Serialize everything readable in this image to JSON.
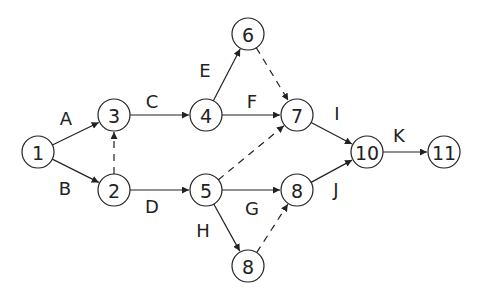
{
  "diagram": {
    "type": "activity-on-arrow network",
    "node_radius": 16,
    "colors": {
      "stroke": "#222222",
      "background": "#ffffff"
    },
    "nodes": [
      {
        "id": "n1",
        "label": "1",
        "x": 38,
        "y": 152
      },
      {
        "id": "n2",
        "label": "2",
        "x": 114,
        "y": 190
      },
      {
        "id": "n3",
        "label": "3",
        "x": 114,
        "y": 115
      },
      {
        "id": "n4",
        "label": "4",
        "x": 206,
        "y": 115
      },
      {
        "id": "n5",
        "label": "5",
        "x": 206,
        "y": 190
      },
      {
        "id": "n6",
        "label": "6",
        "x": 248,
        "y": 34
      },
      {
        "id": "n7",
        "label": "7",
        "x": 297,
        "y": 115
      },
      {
        "id": "n8a",
        "label": "8",
        "x": 297,
        "y": 190
      },
      {
        "id": "n8b",
        "label": "8",
        "x": 248,
        "y": 266
      },
      {
        "id": "n10",
        "label": "10",
        "x": 367,
        "y": 152
      },
      {
        "id": "n11",
        "label": "11",
        "x": 444,
        "y": 152
      }
    ],
    "edges": [
      {
        "from": "n1",
        "to": "n3",
        "label": "A",
        "dashed": false,
        "lx": 66,
        "ly": 118
      },
      {
        "from": "n1",
        "to": "n2",
        "label": "B",
        "dashed": false,
        "lx": 65,
        "ly": 188
      },
      {
        "from": "n2",
        "to": "n3",
        "label": "",
        "dashed": true
      },
      {
        "from": "n3",
        "to": "n4",
        "label": "C",
        "dashed": false,
        "lx": 152,
        "ly": 101
      },
      {
        "from": "n2",
        "to": "n5",
        "label": "D",
        "dashed": false,
        "lx": 152,
        "ly": 206
      },
      {
        "from": "n4",
        "to": "n6",
        "label": "E",
        "dashed": false,
        "lx": 205,
        "ly": 70
      },
      {
        "from": "n4",
        "to": "n7",
        "label": "F",
        "dashed": false,
        "lx": 252,
        "ly": 101
      },
      {
        "from": "n6",
        "to": "n7",
        "label": "",
        "dashed": true
      },
      {
        "from": "n5",
        "to": "n7",
        "label": "",
        "dashed": true
      },
      {
        "from": "n5",
        "to": "n8a",
        "label": "G",
        "dashed": false,
        "lx": 252,
        "ly": 208
      },
      {
        "from": "n5",
        "to": "n8b",
        "label": "H",
        "dashed": false,
        "lx": 203,
        "ly": 230
      },
      {
        "from": "n8b",
        "to": "n8a",
        "label": "",
        "dashed": true
      },
      {
        "from": "n7",
        "to": "n10",
        "label": "I",
        "dashed": false,
        "lx": 337,
        "ly": 113
      },
      {
        "from": "n8a",
        "to": "n10",
        "label": "J",
        "dashed": false,
        "lx": 336,
        "ly": 189
      },
      {
        "from": "n10",
        "to": "n11",
        "label": "K",
        "dashed": false,
        "lx": 399,
        "ly": 135
      }
    ]
  }
}
